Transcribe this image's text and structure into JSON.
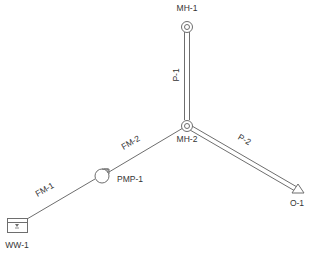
{
  "diagram": {
    "type": "sewer-network",
    "colors": {
      "stroke": "#6e6e6e",
      "text": "#333333",
      "background": "#ffffff"
    },
    "nodes": [
      {
        "id": "MH-1",
        "kind": "manhole",
        "label": "MH-1"
      },
      {
        "id": "MH-2",
        "kind": "manhole",
        "label": "MH-2"
      },
      {
        "id": "PMP-1",
        "kind": "pump",
        "label": "PMP-1"
      },
      {
        "id": "WW-1",
        "kind": "wet-well",
        "label": "WW-1"
      },
      {
        "id": "O-1",
        "kind": "outfall",
        "label": "O-1"
      }
    ],
    "links": [
      {
        "id": "P-1",
        "kind": "gravity-pipe",
        "label": "P-1",
        "from": "MH-1",
        "to": "MH-2"
      },
      {
        "id": "P-2",
        "kind": "gravity-pipe",
        "label": "P-2",
        "from": "MH-2",
        "to": "O-1"
      },
      {
        "id": "FM-1",
        "kind": "force-main",
        "label": "FM-1",
        "from": "WW-1",
        "to": "PMP-1"
      },
      {
        "id": "FM-2",
        "kind": "force-main",
        "label": "FM-2",
        "from": "PMP-1",
        "to": "MH-2"
      }
    ]
  }
}
